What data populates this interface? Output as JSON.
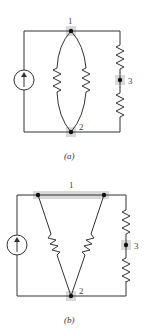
{
  "figure_a": {
    "caption": "(a)",
    "node_labels": {
      "n1": "1",
      "n2": "2",
      "n3": "3"
    },
    "components": [
      "current-source",
      "resistor",
      "resistor",
      "resistor",
      "resistor"
    ]
  },
  "figure_b": {
    "caption": "(b)",
    "node_labels": {
      "n1": "1",
      "n2": "2",
      "n3": "3"
    },
    "components": [
      "current-source",
      "resistor",
      "resistor",
      "resistor",
      "resistor"
    ]
  },
  "colors": {
    "wire": "#333333",
    "node_highlight": "#d9d9d9",
    "node": "#111111"
  }
}
